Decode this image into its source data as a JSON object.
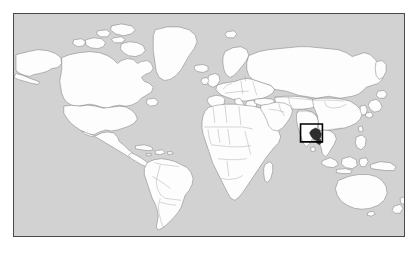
{
  "image": {
    "width_px": 418,
    "height_px": 254,
    "background_color": "#ffffff",
    "type": "world-political-map"
  },
  "map": {
    "frame": {
      "x": 13,
      "y": 13,
      "width": 392,
      "height": 224,
      "border_color": "#4a4a4a",
      "border_width_px": 1
    },
    "ocean_color": "#d2d2d2",
    "land_color": "#fdfdfd",
    "coastline_color": "#707070",
    "country_border_color": "#8a8a8a",
    "projection": "equirectangular",
    "lon_range": [
      -180,
      180
    ],
    "lat_range": [
      -58,
      84
    ],
    "has_labels": false,
    "has_graticule": false,
    "includes_antarctica": false
  },
  "highlight": {
    "box": {
      "x": 300,
      "y": 122,
      "width": 22,
      "height": 18,
      "stroke_color": "#000000",
      "stroke_width_px": 2,
      "fill": "none"
    },
    "region_label": "southeast-asia",
    "country_fill_color": "#2e2e2e",
    "description": "black rectangle outlining a dark-filled country in the Myanmar / Bangladesh area of Southeast Asia"
  },
  "regions": [
    {
      "name": "north-america",
      "visible": true
    },
    {
      "name": "greenland",
      "visible": true
    },
    {
      "name": "iceland",
      "visible": true
    },
    {
      "name": "south-america",
      "visible": true
    },
    {
      "name": "europe",
      "visible": true
    },
    {
      "name": "africa",
      "visible": true
    },
    {
      "name": "madagascar",
      "visible": true
    },
    {
      "name": "asia",
      "visible": true
    },
    {
      "name": "russia",
      "visible": true
    },
    {
      "name": "india",
      "visible": true
    },
    {
      "name": "china",
      "visible": true
    },
    {
      "name": "japan",
      "visible": true
    },
    {
      "name": "indonesia",
      "visible": true
    },
    {
      "name": "philippines",
      "visible": true
    },
    {
      "name": "australia",
      "visible": true
    },
    {
      "name": "new-zealand",
      "visible": true
    },
    {
      "name": "antarctica",
      "visible": false
    }
  ]
}
